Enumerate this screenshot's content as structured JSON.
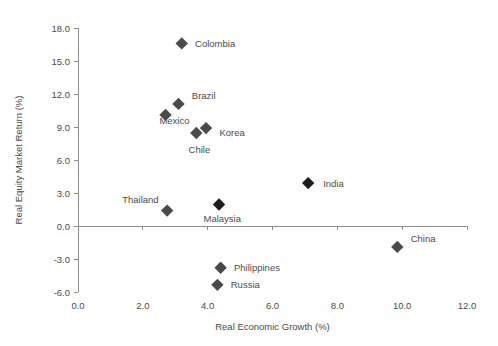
{
  "chart_data": {
    "type": "scatter",
    "title": "",
    "xlabel": "Real Economic Growth (%)",
    "ylabel": "Real Equity Market Return (%)",
    "xlim": [
      0.0,
      12.0
    ],
    "ylim": [
      -6.0,
      18.0
    ],
    "xticks": [
      "0.0",
      "2.0",
      "4.0",
      "6.0",
      "8.0",
      "10.0",
      "12.0"
    ],
    "xtick_values": [
      0.0,
      2.0,
      4.0,
      6.0,
      8.0,
      10.0,
      12.0
    ],
    "yticks": [
      "18.0",
      "15.0",
      "12.0",
      "9.0",
      "6.0",
      "3.0",
      "0.0",
      "-3.0",
      "-6.0"
    ],
    "ytick_values": [
      18.0,
      15.0,
      12.0,
      9.0,
      6.0,
      3.0,
      0.0,
      -3.0,
      -6.0
    ],
    "grid": false,
    "legend": "none",
    "zero_line": true,
    "marker": "diamond",
    "points": [
      {
        "label": "Colombia",
        "x": 3.2,
        "y": 16.6,
        "lx": 3.55,
        "ly": 16.6,
        "anchor": "left",
        "shade": "normal"
      },
      {
        "label": "Brazil",
        "x": 3.1,
        "y": 11.1,
        "lx": 3.45,
        "ly": 11.9,
        "anchor": "left",
        "shade": "normal"
      },
      {
        "label": "Mexico",
        "x": 2.7,
        "y": 10.1,
        "lx": 2.45,
        "ly": 9.6,
        "anchor": "left",
        "shade": "normal"
      },
      {
        "label": "Korea",
        "x": 3.95,
        "y": 8.9,
        "lx": 4.3,
        "ly": 8.5,
        "anchor": "left",
        "shade": "normal"
      },
      {
        "label": "Chile",
        "x": 3.65,
        "y": 8.45,
        "lx": 3.35,
        "ly": 7.0,
        "anchor": "left",
        "shade": "normal"
      },
      {
        "label": "India",
        "x": 7.1,
        "y": 3.9,
        "lx": 7.5,
        "ly": 3.9,
        "anchor": "left",
        "shade": "dark"
      },
      {
        "label": "Thailand",
        "x": 2.75,
        "y": 1.4,
        "lx": 2.55,
        "ly": 2.4,
        "anchor": "right",
        "shade": "normal"
      },
      {
        "label": "Malaysia",
        "x": 4.35,
        "y": 1.95,
        "lx": 4.45,
        "ly": 0.7,
        "anchor": "mid",
        "shade": "dark"
      },
      {
        "label": "China",
        "x": 9.85,
        "y": -1.9,
        "lx": 10.2,
        "ly": -1.1,
        "anchor": "left",
        "shade": "normal"
      },
      {
        "label": "Philippines",
        "x": 4.4,
        "y": -3.8,
        "lx": 4.75,
        "ly": -3.8,
        "anchor": "left",
        "shade": "normal"
      },
      {
        "label": "Russia",
        "x": 4.3,
        "y": -5.35,
        "lx": 4.65,
        "ly": -5.35,
        "anchor": "left",
        "shade": "normal"
      }
    ]
  },
  "colors": {
    "axis": "#8d8d8d",
    "text": "#4a4a4a",
    "marker": "#4a4a4a",
    "marker_dark": "#1c1c1c",
    "background": "#ffffff"
  }
}
